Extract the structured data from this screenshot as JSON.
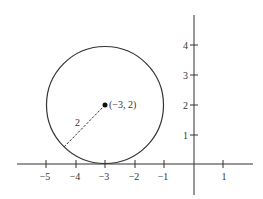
{
  "diagram": {
    "type": "coordinate-plane-circle",
    "circle": {
      "center": [
        -3,
        2
      ],
      "radius": 2,
      "center_label": "(−3, 2)",
      "radius_label": "2"
    },
    "x_axis": {
      "ticks": [
        -5,
        -4,
        -3,
        -2,
        -1,
        1
      ],
      "tick_labels": [
        "−5",
        "−4",
        "−3",
        "−2",
        "−1",
        "1"
      ]
    },
    "y_axis": {
      "ticks": [
        1,
        2,
        3,
        4
      ],
      "tick_labels": [
        "1",
        "2",
        "3",
        "4"
      ]
    },
    "colors": {
      "stroke": "#333333",
      "background": "#ffffff"
    }
  }
}
